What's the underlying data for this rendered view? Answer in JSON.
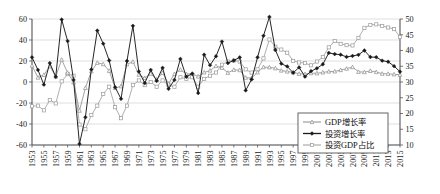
{
  "chart_data": {
    "type": "line",
    "title": "",
    "subtitle": "",
    "xlabel": "",
    "ylabel": "",
    "y2label": "",
    "grid": true,
    "legend_position": "bottom-right",
    "xlim": [
      1953,
      2015
    ],
    "ylim": [
      -60,
      60
    ],
    "y2lim": [
      10,
      50
    ],
    "yticks": [
      -60,
      -40,
      -20,
      0,
      20,
      40,
      60
    ],
    "y2ticks": [
      10,
      15,
      20,
      25,
      30,
      35,
      40,
      45,
      50
    ],
    "xticks": [
      1953,
      1955,
      1957,
      1959,
      1961,
      1963,
      1965,
      1967,
      1969,
      1971,
      1973,
      1975,
      1977,
      1979,
      1981,
      1983,
      1985,
      1987,
      1989,
      1991,
      1993,
      1995,
      1997,
      1999,
      2001,
      2003,
      2005,
      2007,
      2009,
      2011,
      2013,
      2015
    ],
    "x": [
      1953,
      1954,
      1955,
      1956,
      1957,
      1958,
      1959,
      1960,
      1961,
      1962,
      1963,
      1964,
      1965,
      1966,
      1967,
      1968,
      1969,
      1970,
      1971,
      1972,
      1973,
      1974,
      1975,
      1976,
      1977,
      1978,
      1979,
      1980,
      1981,
      1982,
      1983,
      1984,
      1985,
      1986,
      1987,
      1988,
      1989,
      1990,
      1991,
      1992,
      1993,
      1994,
      1995,
      1996,
      1997,
      1998,
      1999,
      2000,
      2001,
      2002,
      2003,
      2004,
      2005,
      2006,
      2007,
      2008,
      2009,
      2010,
      2011,
      2012,
      2013,
      2014,
      2015
    ],
    "series": [
      {
        "name": "GDP增长率",
        "axis": "left",
        "marker": "triangle",
        "color": "#8c8c8c",
        "values": [
          15.6,
          4.2,
          6.8,
          15.0,
          5.1,
          21.3,
          8.8,
          -0.3,
          -27.3,
          -5.6,
          10.2,
          18.3,
          17.0,
          10.7,
          -5.7,
          -4.1,
          16.9,
          19.4,
          7.0,
          3.8,
          7.9,
          2.3,
          8.7,
          -1.6,
          7.6,
          11.7,
          7.6,
          7.8,
          5.2,
          9.1,
          10.9,
          15.2,
          13.5,
          8.8,
          11.6,
          11.3,
          4.1,
          3.8,
          9.2,
          14.2,
          14.0,
          13.1,
          10.9,
          10.0,
          9.3,
          7.8,
          7.6,
          8.4,
          8.3,
          9.1,
          10.0,
          10.1,
          11.4,
          12.7,
          14.2,
          9.7,
          9.4,
          10.6,
          9.5,
          7.9,
          7.8,
          7.3,
          6.9
        ]
      },
      {
        "name": "投资增长率",
        "axis": "left",
        "marker": "diamond",
        "color": "#1a1a1a",
        "values": [
          23.5,
          11.5,
          -2.5,
          18.0,
          5.0,
          59.5,
          39.0,
          2.0,
          -59.0,
          -33.5,
          12.0,
          49.0,
          36.5,
          20.5,
          -5.0,
          -16.0,
          20.0,
          53.5,
          10.0,
          -1.0,
          11.5,
          1.0,
          13.5,
          -6.5,
          2.0,
          22.0,
          5.0,
          8.0,
          -10.5,
          26.0,
          16.0,
          24.5,
          38.5,
          18.0,
          20.5,
          23.5,
          -8.0,
          2.5,
          23.5,
          44.0,
          62.0,
          30.5,
          17.5,
          14.8,
          8.8,
          13.9,
          5.1,
          10.3,
          13.0,
          16.9,
          27.7,
          26.6,
          26.0,
          23.9,
          24.8,
          25.9,
          30.0,
          23.8,
          23.6,
          20.3,
          19.3,
          15.1,
          9.8
        ]
      },
      {
        "name": "投资GDP占比",
        "axis": "right",
        "marker": "square",
        "color": "#9a9a9a",
        "values": [
          22.3,
          22.5,
          21.0,
          24.3,
          23.2,
          30.2,
          32.5,
          32.0,
          16.5,
          15.0,
          19.5,
          22.5,
          26.2,
          28.5,
          22.0,
          18.5,
          22.5,
          29.0,
          30.5,
          29.0,
          30.0,
          28.5,
          30.5,
          29.0,
          28.5,
          31.5,
          31.0,
          31.5,
          28.5,
          31.0,
          32.0,
          33.0,
          35.5,
          36.5,
          36.8,
          36.5,
          34.0,
          33.0,
          34.0,
          37.5,
          43.5,
          41.2,
          40.3,
          39.3,
          36.7,
          36.2,
          36.0,
          35.3,
          36.5,
          37.9,
          41.0,
          43.0,
          42.1,
          41.7,
          41.6,
          44.0,
          47.2,
          48.1,
          48.3,
          47.8,
          47.3,
          46.8,
          44.3
        ]
      }
    ]
  },
  "legend": {
    "items": [
      {
        "label": "GDP增长率",
        "marker": "triangle",
        "color": "#8c8c8c"
      },
      {
        "label": "投资增长率",
        "marker": "diamond",
        "color": "#1a1a1a"
      },
      {
        "label": "投资GDP占比",
        "marker": "square",
        "color": "#9a9a9a"
      }
    ]
  }
}
